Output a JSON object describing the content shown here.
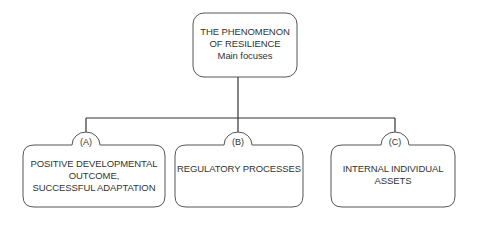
{
  "diagram": {
    "root": {
      "lines": [
        "THE PHENOMENON",
        "OF RESILIENCE",
        "Main focuses"
      ]
    },
    "children": [
      {
        "tag": "(A)",
        "lines": [
          "POSITIVE DEVELOPMENTAL",
          "OUTCOME,",
          "SUCCESSFUL ADAPTATION"
        ]
      },
      {
        "tag": "(B)",
        "lines": [
          "REGULATORY PROCESSES"
        ]
      },
      {
        "tag": "(C)",
        "lines": [
          "INTERNAL INDIVIDUAL",
          "ASSETS"
        ]
      }
    ],
    "colors": {
      "stroke": "#555555",
      "connector": "#333333",
      "text": "#333333",
      "background": "#ffffff"
    }
  }
}
